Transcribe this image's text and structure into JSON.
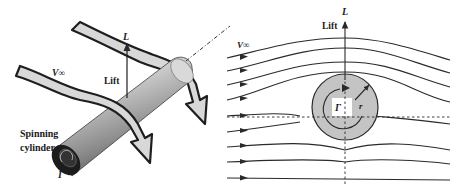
{
  "diagram": {
    "left_panel": {
      "freestream_label": "V∞",
      "lift_symbol": "L",
      "lift_label": "Lift",
      "cylinder_label_line1": "Spinning",
      "cylinder_label_line2": "cylinder",
      "circulation_symbol": "Γ"
    },
    "right_panel": {
      "freestream_label": "V∞",
      "lift_symbol": "L",
      "lift_label": "Lift",
      "circulation_symbol": "Γ",
      "radius_symbol": "r",
      "streamline_count": 9
    },
    "colors": {
      "cylinder_ring": "#c4c4c4",
      "flow_arrow_fill": "#d8d8d8",
      "line": "#2a2a2a"
    }
  }
}
